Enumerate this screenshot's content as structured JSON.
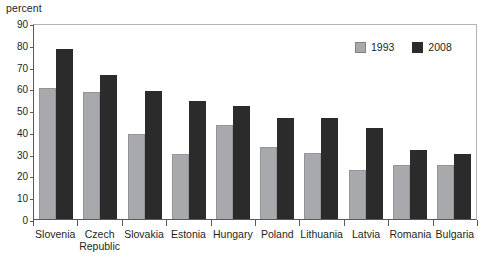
{
  "chart_data": {
    "type": "bar",
    "title": "",
    "subtitle": "",
    "xlabel": "",
    "ylabel": "percent",
    "ylim": [
      0,
      90
    ],
    "ytick_values": [
      0,
      10,
      20,
      30,
      40,
      50,
      60,
      70,
      80,
      90
    ],
    "ytick_labels": [
      "0",
      "10",
      "20",
      "30",
      "40",
      "50",
      "60",
      "70",
      "80",
      "90"
    ],
    "grid": false,
    "legend_position": "top-right",
    "categories": [
      "Slovenia",
      "Czech Republic",
      "Slovakia",
      "Estonia",
      "Hungary",
      "Poland",
      "Lithuania",
      "Latvia",
      "Romania",
      "Bulgaria"
    ],
    "series": [
      {
        "name": "1993",
        "color": "#a7a9ac",
        "values": [
          60,
          58.5,
          39,
          30,
          43,
          33,
          30.5,
          22.5,
          25,
          25
        ]
      },
      {
        "name": "2008",
        "color": "#2b2b2b",
        "values": [
          78,
          66,
          59,
          54,
          52,
          46.5,
          46.5,
          42,
          31.5,
          30
        ]
      }
    ]
  },
  "legend": {
    "items": [
      {
        "label": "1993"
      },
      {
        "label": "2008"
      }
    ]
  },
  "axis": {
    "y_title": "percent"
  },
  "xlabels": [
    {
      "line1": "Slovenia",
      "line2": ""
    },
    {
      "line1": "Czech",
      "line2": "Republic"
    },
    {
      "line1": "Slovakia",
      "line2": ""
    },
    {
      "line1": "Estonia",
      "line2": ""
    },
    {
      "line1": "Hungary",
      "line2": ""
    },
    {
      "line1": "Poland",
      "line2": ""
    },
    {
      "line1": "Lithuania",
      "line2": ""
    },
    {
      "line1": "Latvia",
      "line2": ""
    },
    {
      "line1": "Romania",
      "line2": ""
    },
    {
      "line1": "Bulgaria",
      "line2": ""
    }
  ]
}
